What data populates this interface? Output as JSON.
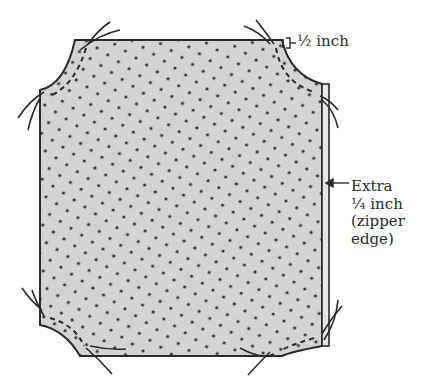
{
  "diagram": {
    "fabric": {
      "fill_color": "#d4d4d4",
      "dot_color": "#333333",
      "outline_color": "#2a2a2a"
    },
    "labels": {
      "seam_allowance": "½ inch",
      "zipper_extra": [
        "Extra",
        "¼ inch",
        "(zipper",
        "edge)"
      ]
    },
    "annotations": [
      {
        "id": "seam-allowance-bracket",
        "target": "top-right corner",
        "text": "½ inch"
      },
      {
        "id": "zipper-edge-arrow",
        "target": "right edge",
        "text": "Extra ¼ inch (zipper edge)"
      }
    ],
    "corners": [
      "top-left",
      "top-right",
      "bottom-left",
      "bottom-right"
    ]
  }
}
